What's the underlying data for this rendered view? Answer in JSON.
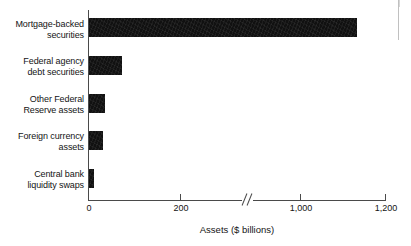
{
  "chart_data": {
    "type": "bar",
    "orientation": "horizontal",
    "title": "",
    "xlabel": "Assets ($ billions)",
    "ylabel": "",
    "categories": [
      "Mortgage-backed\nsecurities",
      "Federal agency\ndebt securities",
      "Other Federal\nReserve assets",
      "Foreign currency\nassets",
      "Central bank\nliquidity swaps"
    ],
    "values": [
      1135,
      72,
      35,
      30,
      10
    ],
    "xlim": [
      0,
      1200
    ],
    "xticks": [
      0,
      200,
      1000,
      1200
    ],
    "xtick_labels": [
      "0",
      "200",
      "1,000",
      "1,200"
    ],
    "axis_break": {
      "present": true,
      "between": [
        200,
        1000
      ],
      "glyph": "double-slash"
    },
    "grid": false,
    "legend": null,
    "bar_color": "#111111",
    "axis_color": "#4a4a4a",
    "background_color": "#ffffff"
  }
}
